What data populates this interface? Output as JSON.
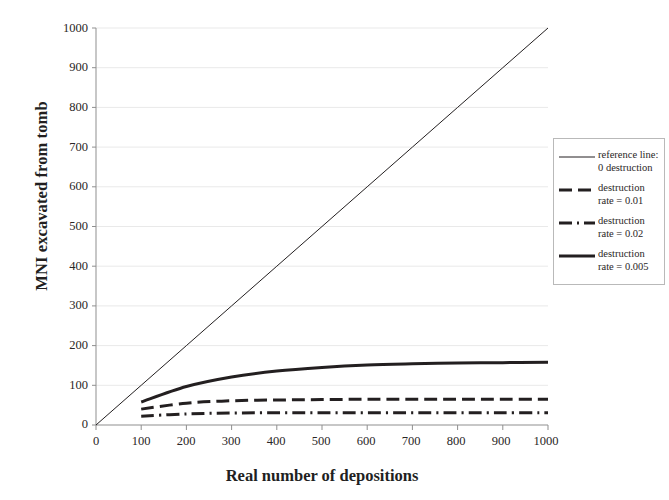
{
  "chart_data": {
    "type": "line",
    "title": "",
    "xlabel": "Real number of depositions",
    "ylabel": "MNI excavated from tomb",
    "xlim": [
      0,
      1000
    ],
    "ylim": [
      0,
      1000
    ],
    "xticks": [
      0,
      100,
      200,
      300,
      400,
      500,
      600,
      700,
      800,
      900,
      1000
    ],
    "yticks": [
      0,
      100,
      200,
      300,
      400,
      500,
      600,
      700,
      800,
      900,
      1000
    ],
    "grid": "horizontal",
    "legend_position": "right-outside",
    "x": [
      0,
      100,
      200,
      300,
      400,
      500,
      600,
      700,
      800,
      900,
      1000
    ],
    "series": [
      {
        "name": "reference line: 0 destruction",
        "style": "solid-thin",
        "color": "#231f20",
        "width": 1,
        "x": [
          0,
          100,
          200,
          300,
          400,
          500,
          600,
          700,
          800,
          900,
          1000
        ],
        "values": [
          0,
          100,
          200,
          300,
          400,
          500,
          600,
          700,
          800,
          900,
          1000
        ]
      },
      {
        "name": "destruction rate = 0.01",
        "style": "dashed",
        "color": "#231f20",
        "width": 3,
        "x": [
          100,
          200,
          300,
          400,
          500,
          600,
          700,
          800,
          900,
          1000
        ],
        "values": [
          40,
          55,
          61,
          63,
          64,
          65,
          65,
          65,
          65,
          65
        ]
      },
      {
        "name": "destruction rate = 0.02",
        "style": "dash-dot",
        "color": "#231f20",
        "width": 3,
        "x": [
          100,
          200,
          300,
          400,
          500,
          600,
          700,
          800,
          900,
          1000
        ],
        "values": [
          22,
          28,
          30,
          31,
          31,
          31,
          31,
          31,
          31,
          31
        ]
      },
      {
        "name": "destruction rate = 0.005",
        "style": "solid-thick",
        "color": "#231f20",
        "width": 3,
        "x": [
          100,
          200,
          300,
          400,
          500,
          600,
          700,
          800,
          900,
          1000
        ],
        "values": [
          58,
          97,
          121,
          136,
          145,
          151,
          154,
          156,
          157,
          158
        ]
      }
    ]
  },
  "axes": {
    "y_title": "MNI excavated from tomb",
    "x_title": "Real number of depositions",
    "y_tick_labels": [
      "1000",
      "900",
      "800",
      "700",
      "600",
      "500",
      "400",
      "300",
      "200",
      "100",
      "0"
    ],
    "x_tick_labels": [
      "0",
      "100",
      "200",
      "300",
      "400",
      "500",
      "600",
      "700",
      "800",
      "900",
      "1000"
    ]
  },
  "legend": {
    "items": [
      {
        "line1": "reference line:",
        "line2": "0 destruction",
        "sample": "solid-thin"
      },
      {
        "line1": "destruction",
        "line2": "rate = 0.01",
        "sample": "dashed"
      },
      {
        "line1": "destruction",
        "line2": "rate = 0.02",
        "sample": "dash-dot"
      },
      {
        "line1": "destruction",
        "line2": "rate = 0.005",
        "sample": "solid-thick"
      }
    ]
  },
  "colors": {
    "line": "#231f20",
    "grid": "#e9e9e9",
    "axis": "#8f8f8f",
    "legend_border": "#b9b9b9",
    "background": "#ffffff"
  }
}
